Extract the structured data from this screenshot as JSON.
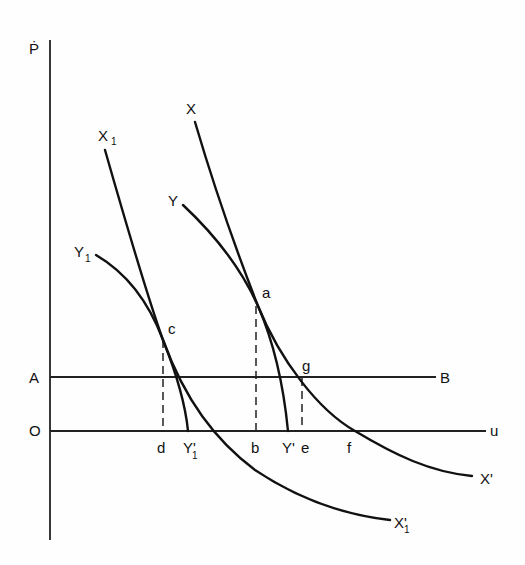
{
  "diagram": {
    "type": "economics-phase-diagram",
    "axes": {
      "y_label": "Ṗ",
      "x_label": "u",
      "origin_label": "O"
    },
    "horizontal_line": {
      "start_label": "A",
      "end_label": "B"
    },
    "curves": [
      {
        "id": "X",
        "start_label": "X",
        "end_label": "X'",
        "end_sub": ""
      },
      {
        "id": "Y",
        "start_label": "Y",
        "end_label": "Y'",
        "end_sub": ""
      },
      {
        "id": "X1",
        "start_label": "X",
        "start_sub": "1",
        "end_label": "X'",
        "end_sub": "1"
      },
      {
        "id": "Y1",
        "start_label": "Y",
        "start_sub": "1",
        "end_label": "Y'",
        "end_sub": "1"
      }
    ],
    "points": {
      "a": "a",
      "c": "c",
      "g": "g"
    },
    "x_axis_marks": {
      "d": "d",
      "b": "b",
      "e": "e",
      "f": "f"
    }
  },
  "colors": {
    "ink": "#111111",
    "paper": "#fefefe"
  }
}
